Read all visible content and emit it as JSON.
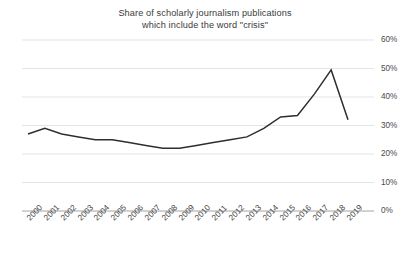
{
  "chart_data": {
    "type": "line",
    "title": "Share of scholarly journalism publications\nwhich include the word \"crisis\"",
    "title_line1": "Share of scholarly journalism publications",
    "title_line2": "which include the word \"crisis\"",
    "xlabel": "",
    "ylabel": "",
    "ylim": [
      0,
      60
    ],
    "y_ticks": [
      "0%",
      "10%",
      "20%",
      "30%",
      "40%",
      "50%",
      "60%"
    ],
    "y_tick_values": [
      0,
      10,
      20,
      30,
      40,
      50,
      60
    ],
    "y_axis_position": "right",
    "grid": true,
    "legend": false,
    "line_color": "#2e2e2e",
    "grid_color": "#d8d8d8",
    "categories": [
      "2000",
      "2001",
      "2002",
      "2003",
      "2004",
      "2005",
      "2006",
      "2007",
      "2008",
      "2009",
      "2010",
      "2011",
      "2012",
      "2013",
      "2014",
      "2015",
      "2016",
      "2017",
      "2018",
      "2019"
    ],
    "values": [
      27,
      29,
      27,
      26,
      25,
      25,
      24,
      23,
      22,
      22,
      23,
      24,
      25,
      26,
      29,
      33,
      33.5,
      41,
      49.5,
      32
    ]
  }
}
